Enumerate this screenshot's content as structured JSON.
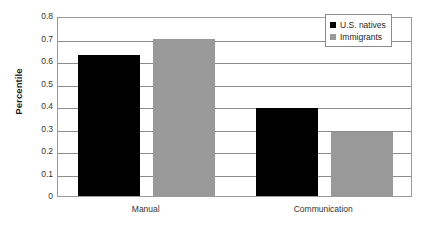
{
  "chart_data": {
    "type": "bar",
    "title": "",
    "xlabel": "",
    "ylabel": "Percentile",
    "categories": [
      "Manual",
      "Communication"
    ],
    "series": [
      {
        "name": "U.S. natives",
        "color": "#000000",
        "values": [
          0.625,
          0.39
        ]
      },
      {
        "name": "Immigrants",
        "color": "#999999",
        "values": [
          0.7,
          0.285
        ]
      }
    ],
    "ylim": [
      0,
      0.8
    ],
    "ytick_step": 0.1,
    "ytick_labels": [
      "0.8",
      "0.7",
      "0.6",
      "0.5",
      "0.4",
      "0.3",
      "0.2",
      "0.1",
      "0"
    ],
    "ytick_values": [
      0.8,
      0.7,
      0.6,
      0.5,
      0.4,
      0.3,
      0.2,
      0.1,
      0
    ],
    "grid": true,
    "legend_position": "top-right"
  }
}
